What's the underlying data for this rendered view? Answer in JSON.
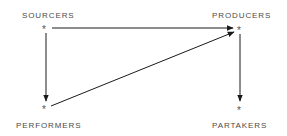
{
  "diagram": {
    "nodes": [
      {
        "id": "sourcers",
        "label": "SOURCERS",
        "marker": "*"
      },
      {
        "id": "producers",
        "label": "PRODUCERS",
        "marker": "*"
      },
      {
        "id": "performers",
        "label": "PERFORMERS",
        "marker": "*"
      },
      {
        "id": "partakers",
        "label": "PARTAKERS",
        "marker": "*"
      }
    ],
    "edges": [
      {
        "from": "sourcers",
        "to": "producers"
      },
      {
        "from": "sourcers",
        "to": "performers"
      },
      {
        "from": "performers",
        "to": "producers"
      },
      {
        "from": "producers",
        "to": "partakers"
      }
    ],
    "colors": {
      "line": "#1a1a1a",
      "text": "#4a4a4a"
    }
  }
}
